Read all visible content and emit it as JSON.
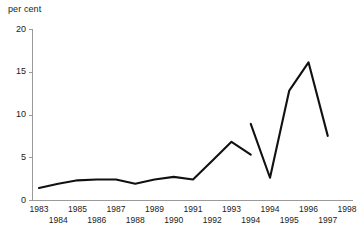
{
  "chart_data": {
    "type": "line",
    "title": "",
    "subtitle": "",
    "xlabel": "",
    "ylabel": "per cent",
    "ylim": [
      0,
      20
    ],
    "yticks": [
      0,
      5,
      10,
      15,
      20
    ],
    "ytick_labels": [
      "0",
      "5",
      "10",
      "15",
      "20"
    ],
    "grid": false,
    "legend": "none",
    "x_axis_note": "Year 1994 appears twice: it terminates the first series and begins the second series",
    "x_tick_labels_top_row": [
      "1983",
      "1985",
      "1987",
      "1989",
      "1991",
      "1993",
      "1995",
      "1997"
    ],
    "x_tick_labels_bottom_row": [
      "1984",
      "1986",
      "1988",
      "1990",
      "1992",
      "1994",
      "1994",
      "1996",
      "1998"
    ],
    "categories": [
      "1983",
      "1984",
      "1985",
      "1986",
      "1987",
      "1988",
      "1989",
      "1990",
      "1991",
      "1992",
      "1993",
      "1994",
      "1994",
      "1995",
      "1996",
      "1997",
      "1998"
    ],
    "series": [
      {
        "name": "series-1",
        "x": [
          "1983",
          "1984",
          "1985",
          "1986",
          "1987",
          "1988",
          "1989",
          "1990",
          "1991",
          "1992",
          "1993",
          "1994"
        ],
        "values": [
          1.4,
          1.9,
          2.3,
          2.4,
          2.4,
          1.9,
          2.4,
          2.7,
          2.4,
          4.6,
          6.8,
          5.3
        ],
        "color": "#111111"
      },
      {
        "name": "series-2",
        "x": [
          "1994",
          "1995",
          "1996",
          "1997",
          "1998"
        ],
        "values": [
          8.9,
          2.6,
          12.8,
          16.1,
          7.5
        ],
        "color": "#111111"
      }
    ]
  },
  "axis": {
    "y_title": "per cent"
  }
}
